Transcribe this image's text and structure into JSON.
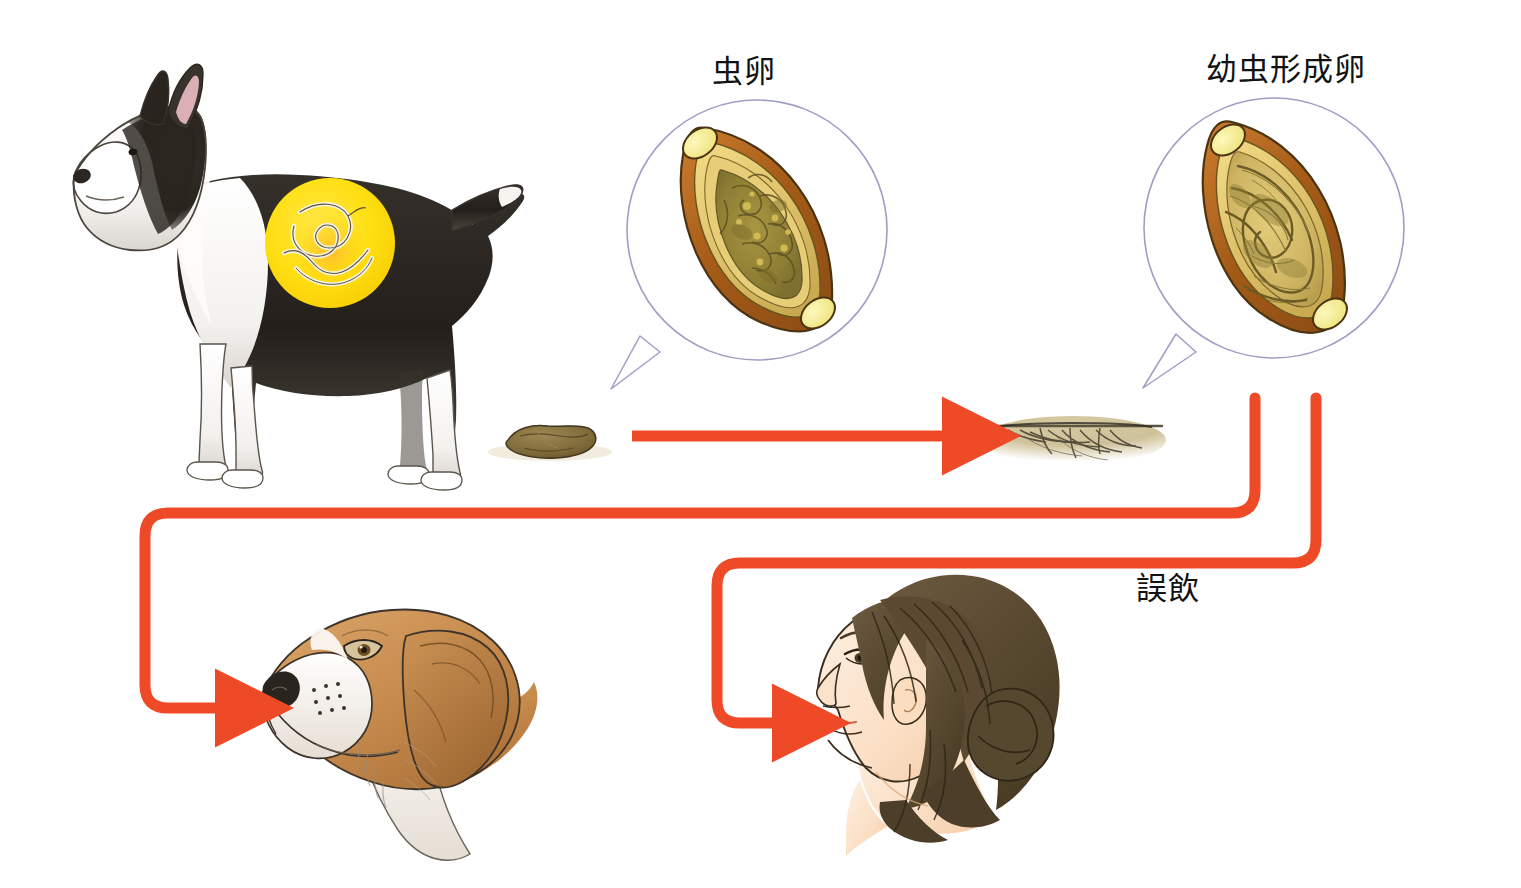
{
  "diagram": {
    "title_labels": {
      "ova": "虫卵",
      "larvated_ova": "幼虫形成卵",
      "accidental_ingestion": "誤飲"
    },
    "colors": {
      "arrow_red": "#EF4A28",
      "highlight_yellow": "#FFE01A",
      "bubble_stroke": "#9e9fc4",
      "egg_shell": "#b5661f",
      "egg_inner": "#e0bd5c",
      "egg_plug": "#f5ef9a",
      "egg_content": "#9a8c3c",
      "soil_tan": "#cdc099",
      "feces_brown": "#8a7542",
      "beagle_tan": "#c8884a",
      "hair_brown": "#5d4c33",
      "skin": "#fbe0c8",
      "dog_black": "#2b2722",
      "ink": "#121212"
    },
    "elements": {
      "bull_terrier": "bull-terrier-illustration",
      "worm_highlight": "roundworm-highlight-circle",
      "feces": "dog-feces-illustration",
      "soil": "soil-with-roots-illustration",
      "ova_bubble": "ova-magnifier-bubble",
      "larvated_bubble": "larvated-ova-magnifier-bubble",
      "beagle": "beagle-head-illustration",
      "woman": "woman-head-illustration"
    },
    "flow": {
      "steps": [
        {
          "from": "feces",
          "to": "soil",
          "kind": "straight-arrow"
        },
        {
          "from": "larvated_ova",
          "to": "beagle",
          "kind": "routed-arrow"
        },
        {
          "from": "larvated_ova",
          "to": "woman",
          "kind": "routed-arrow",
          "label": "誤飲"
        }
      ]
    }
  }
}
